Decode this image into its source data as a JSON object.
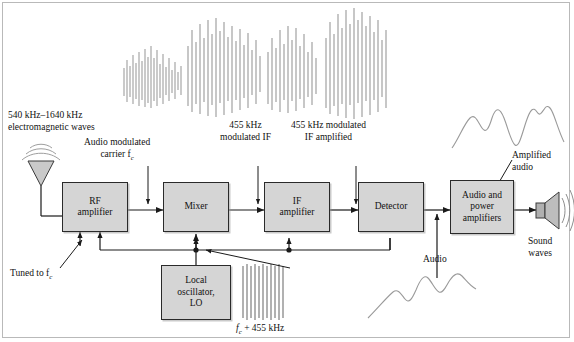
{
  "diagram": {
    "blocks": [
      {
        "id": "rf_amplifier",
        "line1": "RF",
        "line2": "amplifier"
      },
      {
        "id": "mixer",
        "line1": "Mixer",
        "line2": ""
      },
      {
        "id": "if_amplifier",
        "line1": "IF",
        "line2": "amplifier"
      },
      {
        "id": "detector",
        "line1": "Detector",
        "line2": ""
      },
      {
        "id": "audio_power",
        "line1": "Audio and",
        "line2": "power",
        "line3": "amplifiers"
      },
      {
        "id": "local_osc",
        "line1": "Local",
        "line2": "oscillator,",
        "line3": "LO"
      }
    ],
    "labels": {
      "incoming_line1": "540 kHz–1640 kHz",
      "incoming_line2": "electromagnetic waves",
      "audio_modulated_line1": "Audio modulated",
      "audio_modulated_line2": "carrier f",
      "audio_modulated_sub": "c",
      "if_455_line1": "455 kHz",
      "if_455_line2": "modulated IF",
      "if_amp_line1": "455 kHz modulated",
      "if_amp_line2": "IF amplified",
      "amplified_audio_line1": "Amplified",
      "amplified_audio_line2": "audio",
      "sound_waves_line1": "Sound",
      "sound_waves_line2": "waves",
      "tuned_to": "Tuned to f",
      "tuned_to_sub": "c",
      "audio": "Audio",
      "lo_freq_pre": "f",
      "lo_freq_sub": "c",
      "lo_freq_post": " + 455 kHz"
    },
    "colors": {
      "block_fill": "#d5d5d5",
      "block_stroke": "#2a2a2a",
      "wire": "#1a1a1a",
      "waveform": "#9a9a9a",
      "frame": "#b9b9b9",
      "antenna_fill": "#c9c9c9",
      "speaker_fill": "#b5b5b5"
    },
    "waveforms": [
      {
        "id": "audio-signal-waveform",
        "type": "modulated-carrier-dense"
      },
      {
        "id": "rf-carrier-waveform",
        "type": "modulated-carrier-dense"
      },
      {
        "id": "if-modulated-waveform",
        "type": "modulated-carrier-dense"
      },
      {
        "id": "if-amplified-waveform",
        "type": "modulated-carrier-dense"
      },
      {
        "id": "lo-carrier-waveform",
        "type": "uniform-carrier"
      },
      {
        "id": "amplified-audio-waveform",
        "type": "audio-curve"
      },
      {
        "id": "detected-audio-waveform",
        "type": "audio-curve"
      }
    ]
  }
}
